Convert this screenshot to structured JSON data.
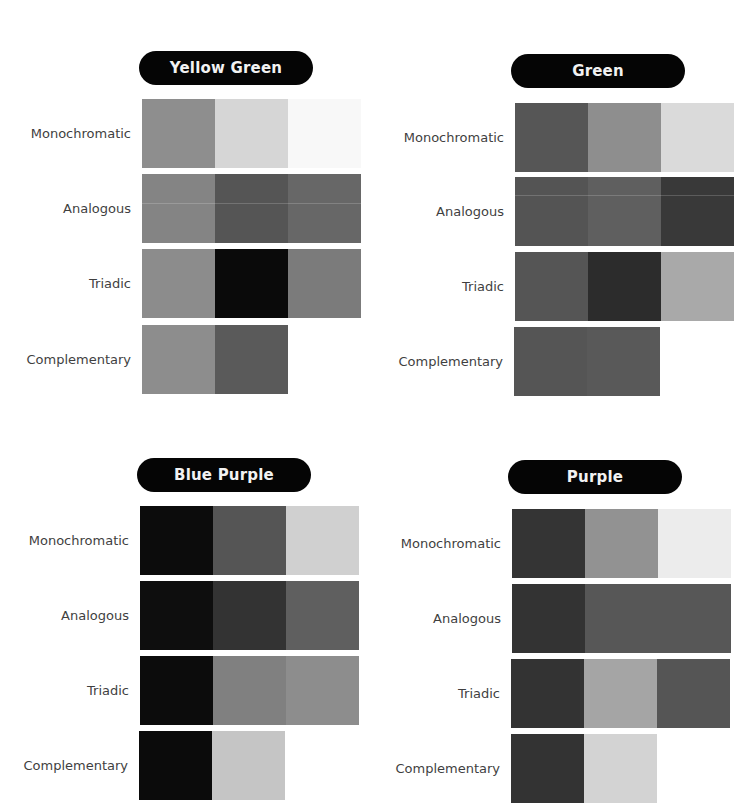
{
  "panels": [
    {
      "title": "Yellow Green",
      "rows": [
        {
          "label": "Monochromatic",
          "colors": [
            "#8e8e8e",
            "#d6d6d6",
            "#f8f8f8"
          ]
        },
        {
          "label": "Analogous",
          "colors": [
            "#848484",
            "#555555",
            "#676767"
          ]
        },
        {
          "label": "Triadic",
          "colors": [
            "#8c8c8c",
            "#0a0a0a",
            "#7b7b7b"
          ]
        },
        {
          "label": "Complementary",
          "colors": [
            "#8d8d8d",
            "#5a5a5a"
          ]
        }
      ]
    },
    {
      "title": "Green",
      "rows": [
        {
          "label": "Monochromatic",
          "colors": [
            "#565656",
            "#8e8e8e",
            "#dadada"
          ]
        },
        {
          "label": "Analogous",
          "colors": [
            "#545454",
            "#5f5f5f",
            "#393939"
          ]
        },
        {
          "label": "Triadic",
          "colors": [
            "#555555",
            "#2c2c2c",
            "#a9a9a9"
          ]
        },
        {
          "label": "Complementary",
          "colors": [
            "#555555",
            "#595959"
          ]
        }
      ]
    },
    {
      "title": "Blue Purple",
      "rows": [
        {
          "label": "Monochromatic",
          "colors": [
            "#0c0c0c",
            "#555555",
            "#d0d0d0"
          ]
        },
        {
          "label": "Analogous",
          "colors": [
            "#0e0e0e",
            "#333333",
            "#5f5f5f"
          ]
        },
        {
          "label": "Triadic",
          "colors": [
            "#0c0c0c",
            "#808080",
            "#8d8d8d"
          ]
        },
        {
          "label": "Complementary",
          "colors": [
            "#0b0b0b",
            "#c5c5c5"
          ]
        }
      ]
    },
    {
      "title": "Purple",
      "rows": [
        {
          "label": "Monochromatic",
          "colors": [
            "#343434",
            "#929292",
            "#ececec"
          ]
        },
        {
          "label": "Analogous",
          "colors": [
            "#333333",
            "#575757"
          ]
        },
        {
          "label": "Triadic",
          "colors": [
            "#333333",
            "#a5a5a5",
            "#555555"
          ]
        },
        {
          "label": "Complementary",
          "colors": [
            "#333333",
            "#d3d3d3"
          ]
        }
      ]
    }
  ]
}
